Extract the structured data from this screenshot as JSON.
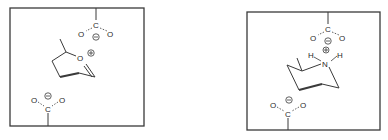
{
  "panels": [
    {
      "id": "left",
      "description": "Oxocarbenium-like cyclic cation (2-methyl dihydropyranium) sandwiched between two carboxylates",
      "cation": {
        "atom": "O",
        "charge": "⊕"
      },
      "top_carboxylate": {
        "c": "C",
        "o1": "O",
        "o2": "O",
        "charge": "⊖"
      },
      "bottom_carboxylate": {
        "c": "C",
        "o1": "O",
        "o2": "O",
        "charge": "⊖"
      }
    },
    {
      "id": "right",
      "description": "Protonated 2-methylpiperidinium (chair) sandwiched between two carboxylates",
      "cation": {
        "atom": "N",
        "h1": "H",
        "h2": "H",
        "charge": "⊕"
      },
      "top_carboxylate": {
        "c": "C",
        "o1": "O",
        "o2": "O",
        "charge": "⊖"
      },
      "bottom_carboxylate": {
        "c": "C",
        "o1": "O",
        "o2": "O",
        "charge": "⊖"
      }
    }
  ],
  "colors": {
    "line": "#3a3a3a",
    "background": "#ffffff"
  }
}
